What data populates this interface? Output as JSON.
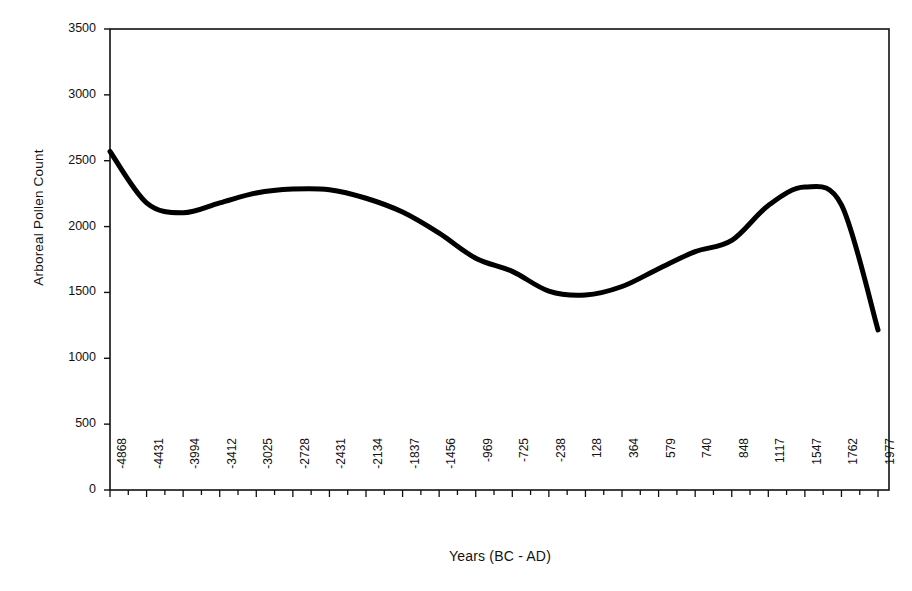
{
  "chart_data": {
    "type": "line",
    "title": "",
    "xlabel": "Years (BC - AD)",
    "ylabel": "Arboreal Pollen Count",
    "ylim": [
      0,
      3500
    ],
    "ytick_labels": [
      "0",
      "500",
      "1000",
      "1500",
      "2000",
      "2500",
      "3000",
      "3500"
    ],
    "ytick_values": [
      0,
      500,
      1000,
      1500,
      2000,
      2500,
      3000,
      3500
    ],
    "grid": false,
    "legend": false,
    "legend_position": "none",
    "line_color": "#000000",
    "line_width": 5,
    "categories": [
      "-4868",
      "-4431",
      "-3994",
      "-3412",
      "-3025",
      "-2728",
      "-2431",
      "-2134",
      "-1837",
      "-1456",
      "-969",
      "-725",
      "-238",
      "128",
      "364",
      "579",
      "740",
      "848",
      "1117",
      "1547",
      "1762",
      "1977"
    ],
    "x_values": [
      -4868,
      -4431,
      -3994,
      -3412,
      -3025,
      -2728,
      -2431,
      -2134,
      -1837,
      -1456,
      -969,
      -725,
      -238,
      128,
      364,
      579,
      740,
      848,
      1117,
      1547,
      1762,
      1977
    ],
    "values": [
      2570,
      2180,
      2105,
      2180,
      2255,
      2285,
      2280,
      2215,
      2110,
      1950,
      1760,
      1660,
      1510,
      1480,
      1545,
      1680,
      1810,
      1895,
      2160,
      2300,
      2165,
      1215
    ],
    "series": [
      {
        "name": "Arboreal Pollen Count",
        "values": [
          2570,
          2180,
          2105,
          2180,
          2255,
          2285,
          2280,
          2215,
          2110,
          1950,
          1760,
          1660,
          1510,
          1480,
          1545,
          1680,
          1810,
          1895,
          2160,
          2300,
          2165,
          1215
        ]
      }
    ],
    "annotations": [
      {
        "label": "start",
        "x": "-4868",
        "y": 2570
      },
      {
        "label": "first-minimum",
        "x": "-3994",
        "y": 2105
      },
      {
        "label": "first-peak",
        "x": "-2728",
        "y": 2285
      },
      {
        "label": "central-minimum",
        "x": "128",
        "y": 1480
      },
      {
        "label": "second-peak",
        "x": "1547",
        "y": 2300
      },
      {
        "label": "end",
        "x": "1977",
        "y": 1215
      }
    ]
  }
}
